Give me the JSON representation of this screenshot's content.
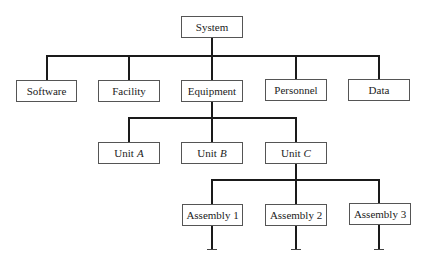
{
  "diagram": {
    "type": "hierarchy-tree",
    "root": {
      "label": "System"
    },
    "level1": [
      {
        "label": "Software"
      },
      {
        "label": "Facility"
      },
      {
        "label": "Equipment"
      },
      {
        "label": "Personnel"
      },
      {
        "label": "Data"
      }
    ],
    "level2": [
      {
        "prefix": "Unit",
        "suffix": "A"
      },
      {
        "prefix": "Unit",
        "suffix": "B"
      },
      {
        "prefix": "Unit",
        "suffix": "C"
      }
    ],
    "level3": [
      {
        "label": "Assembly 1"
      },
      {
        "label": "Assembly 2"
      },
      {
        "label": "Assembly 3"
      }
    ],
    "edges": [
      [
        "System",
        "Software"
      ],
      [
        "System",
        "Facility"
      ],
      [
        "System",
        "Equipment"
      ],
      [
        "System",
        "Personnel"
      ],
      [
        "System",
        "Data"
      ],
      [
        "Equipment",
        "Unit A"
      ],
      [
        "Equipment",
        "Unit B"
      ],
      [
        "Equipment",
        "Unit C"
      ],
      [
        "Unit C",
        "Assembly 1"
      ],
      [
        "Unit C",
        "Assembly 2"
      ],
      [
        "Unit C",
        "Assembly 3"
      ]
    ],
    "line_color": "#1a1a1a"
  }
}
